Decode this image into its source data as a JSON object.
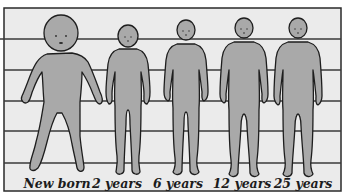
{
  "diagram": {
    "colors": {
      "background": "#ebebeb",
      "frame": "#2a2a2a",
      "grid_line": "#3a3a3a",
      "figure_fill": "#a9a9a9",
      "figure_outline": "#1e1e1e"
    },
    "grid_lines_y": [
      39,
      70,
      101,
      131,
      163
    ],
    "figures": [
      {
        "label": "New born",
        "cx": 62,
        "label_x": 57
      },
      {
        "label": "2 years",
        "cx": 128,
        "label_x": 117
      },
      {
        "label": "6 years",
        "cx": 186,
        "label_x": 178
      },
      {
        "label": "12 years",
        "cx": 244,
        "label_x": 242
      },
      {
        "label": "25 years",
        "cx": 298,
        "label_x": 303
      }
    ]
  }
}
